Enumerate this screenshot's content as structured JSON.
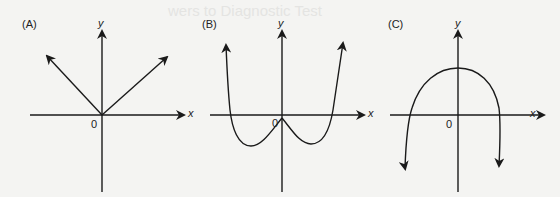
{
  "background_ghost_text": "wers to Diagnostic Test",
  "panels": [
    {
      "label": "(A)",
      "x_axis_label": "x",
      "y_axis_label": "y",
      "origin_label": "0",
      "description": "V-shaped graph with two rays from origin, arrows pointing up-left and up-right (y = |x| type)"
    },
    {
      "label": "(B)",
      "x_axis_label": "x",
      "y_axis_label": "y",
      "origin_label": "0",
      "description": "W-shaped curve with cusp at origin, two minima below x-axis, arms rising with arrows"
    },
    {
      "label": "(C)",
      "x_axis_label": "x",
      "y_axis_label": "y",
      "origin_label": "0",
      "description": "Downward-opening curve with maximum on positive y-axis, arms descending with arrows"
    }
  ],
  "colors": {
    "ink": "#1a1a1a",
    "paper": "#f4f4f2"
  }
}
